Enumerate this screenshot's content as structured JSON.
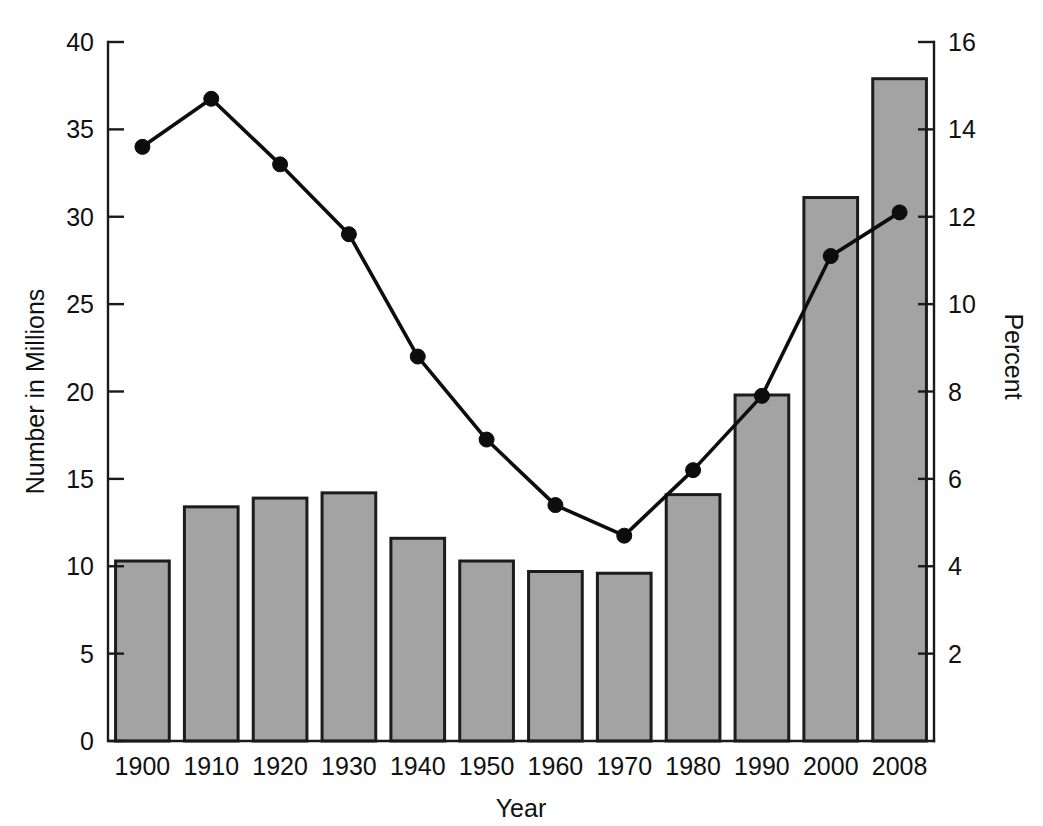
{
  "chart_data": {
    "type": "bar",
    "title": "",
    "subtitle": "",
    "xlabel": "Year",
    "ylabel": "Number in Millions",
    "y2label": "Percent",
    "categories": [
      "1900",
      "1910",
      "1920",
      "1930",
      "1940",
      "1950",
      "1960",
      "1970",
      "1980",
      "1990",
      "2000",
      "2008"
    ],
    "ylim": [
      0,
      40
    ],
    "yticks": [
      0,
      5,
      10,
      15,
      20,
      25,
      30,
      35,
      40
    ],
    "ytick_labels": [
      "0",
      "5",
      "10",
      "15",
      "20",
      "25",
      "30",
      "35",
      "40"
    ],
    "y2lim": [
      0,
      16
    ],
    "y2ticks": [
      2,
      4,
      6,
      8,
      10,
      12,
      14,
      16
    ],
    "y2tick_labels": [
      "2",
      "4",
      "6",
      "8",
      "10",
      "12",
      "14",
      "16"
    ],
    "grid": false,
    "legend": false,
    "legend_position": "none",
    "series": [
      {
        "name": "Number in Millions",
        "type": "bar",
        "axis": "left",
        "color": "#a3a3a3",
        "edge_color": "#1c1c1c",
        "values": [
          10.3,
          13.4,
          13.9,
          14.2,
          11.6,
          10.3,
          9.7,
          9.6,
          14.1,
          19.8,
          31.1,
          37.9
        ]
      },
      {
        "name": "Percent",
        "type": "line",
        "axis": "right",
        "color": "#0d0d0d",
        "marker": "circle",
        "values": [
          13.6,
          14.7,
          13.2,
          11.6,
          8.8,
          6.9,
          5.4,
          4.7,
          6.2,
          7.9,
          11.1,
          12.1
        ]
      }
    ]
  },
  "axes": {
    "x_axis_title": "Year",
    "y_left_title": "Number in Millions",
    "y_right_title": "Percent"
  }
}
